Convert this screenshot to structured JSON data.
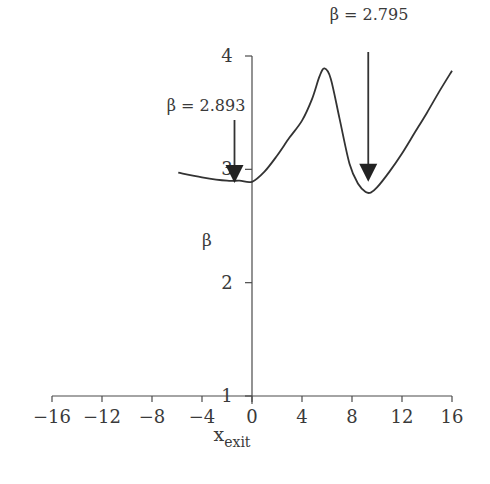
{
  "chart_data": {
    "type": "line",
    "title": "",
    "xlabel": "x",
    "xlabel_subscript": "exit",
    "ylabel": "β",
    "xlim": [
      -16,
      16
    ],
    "ylim": [
      1,
      4
    ],
    "xticks": [
      -16,
      -12,
      -8,
      -4,
      0,
      4,
      8,
      12,
      16
    ],
    "xtick_labels": [
      "−16",
      "−12",
      "−8",
      "−4",
      "0",
      "4",
      "8",
      "12",
      "16"
    ],
    "yticks": [
      1,
      2,
      3,
      4
    ],
    "ytick_labels": [
      "1",
      "2",
      "3",
      "4"
    ],
    "grid": false,
    "series": [
      {
        "name": "β",
        "x": [
          -5.9,
          -4,
          -2,
          -1,
          0,
          1,
          2,
          3,
          4,
          4.8,
          5.4,
          5.8,
          6.3,
          7,
          7.8,
          8.5,
          9.1,
          9.5,
          10,
          11,
          12,
          13,
          14,
          15,
          16
        ],
        "y": [
          2.97,
          2.93,
          2.9,
          2.9,
          2.89,
          2.98,
          3.12,
          3.28,
          3.43,
          3.62,
          3.82,
          3.89,
          3.8,
          3.45,
          3.05,
          2.87,
          2.8,
          2.795,
          2.84,
          2.98,
          3.14,
          3.32,
          3.5,
          3.69,
          3.87
        ]
      }
    ],
    "annotations": [
      {
        "label": "β = 2.893",
        "arrow_x": -1.4,
        "arrow_tip_y": 2.88
      },
      {
        "label": "β = 2.795",
        "arrow_x": 9.3,
        "arrow_tip_y": 2.89
      }
    ]
  },
  "labels": {
    "annotation_left": "β = 2.893",
    "annotation_right": "β = 2.795",
    "ylabel": "β",
    "xlabel_main": "x",
    "xlabel_sub": "exit"
  }
}
